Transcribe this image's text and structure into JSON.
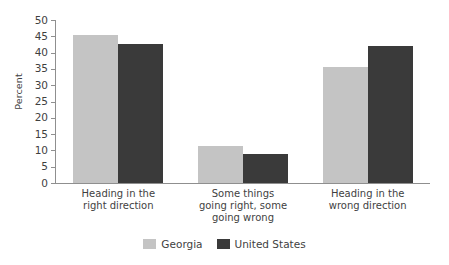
{
  "chart_data": {
    "type": "bar",
    "title": "",
    "subtitle": "",
    "xlabel": "",
    "ylabel": "Percent",
    "ylim": [
      0,
      50
    ],
    "yticks": [
      0,
      5,
      10,
      15,
      20,
      25,
      30,
      35,
      40,
      45,
      50
    ],
    "ytick_labels": [
      "0",
      "5",
      "10",
      "15",
      "20",
      "25",
      "30",
      "35",
      "40",
      "45",
      "50"
    ],
    "grid": false,
    "legend_position": "bottom-center",
    "categories": [
      "Heading in the\nright direction",
      "Some things\ngoing right, some\ngoing wrong",
      "Heading in the\nwrong direction"
    ],
    "category_lines": [
      [
        "Heading in the",
        "right direction"
      ],
      [
        "Some things",
        "going right, some",
        "going wrong"
      ],
      [
        "Heading in the",
        "wrong direction"
      ]
    ],
    "series": [
      {
        "name": "Georgia",
        "color": "#c4c4c4",
        "values": [
          45.5,
          11.5,
          35.5
        ]
      },
      {
        "name": "United States",
        "color": "#3a3a3a",
        "values": [
          42.5,
          9,
          42
        ]
      }
    ]
  },
  "legend": {
    "entries": [
      {
        "label": "Georgia",
        "swatch": "#c4c4c4"
      },
      {
        "label": "United States",
        "swatch": "#3a3a3a"
      }
    ]
  },
  "axis": {
    "y_title": "Percent"
  },
  "colors": {
    "georgia": "#c4c4c4",
    "united_states": "#3a3a3a",
    "axis": "#8f8f8f",
    "text": "#3f3f3f",
    "background": "#ffffff"
  }
}
